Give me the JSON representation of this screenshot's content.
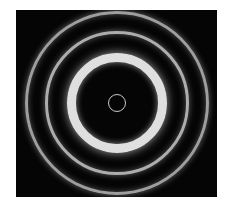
{
  "figure": {
    "background_color": "#050505",
    "ring_color": "#d8d8d8",
    "center": [
      101,
      93
    ],
    "rings": [
      {
        "radius": 9,
        "width": 1.5,
        "brightness": 0.85
      },
      {
        "radius": 48,
        "width": 8,
        "brightness": 1.0
      },
      {
        "radius": 72,
        "width": 3,
        "brightness": 0.75
      },
      {
        "radius": 92,
        "width": 3,
        "brightness": 0.7
      }
    ]
  }
}
